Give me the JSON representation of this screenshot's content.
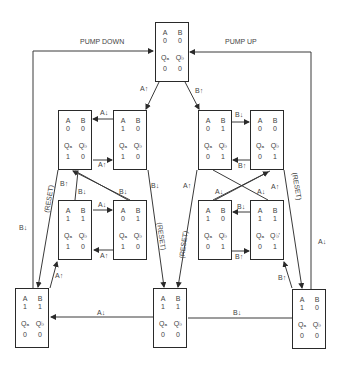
{
  "title_labels": {
    "pump_down": "PUMP DOWN",
    "pump_up": "PUMP UP"
  },
  "headers": {
    "a": "A",
    "b": "B",
    "qa": "Qₐ",
    "qb": "Q_b"
  },
  "states": [
    {
      "id": "top",
      "A": "0",
      "B": "0",
      "Qa": "0",
      "Qb": "0"
    },
    {
      "id": "ul1",
      "A": "0",
      "B": "0",
      "Qa": "1",
      "Qb": "0"
    },
    {
      "id": "ul2",
      "A": "1",
      "B": "0",
      "Qa": "1",
      "Qb": "0"
    },
    {
      "id": "ll1",
      "A": "1",
      "B": "1",
      "Qa": "1",
      "Qb": "0"
    },
    {
      "id": "ll2",
      "A": "0",
      "B": "1",
      "Qa": "1",
      "Qb": "0"
    },
    {
      "id": "ur1",
      "A": "0",
      "B": "1",
      "Qa": "0",
      "Qb": "1"
    },
    {
      "id": "ur2",
      "A": "0",
      "B": "0",
      "Qa": "0",
      "Qb": "1"
    },
    {
      "id": "lr1",
      "A": "1",
      "B": "0",
      "Qa": "0",
      "Qb": "1"
    },
    {
      "id": "lr2",
      "A": "1",
      "B": "1",
      "Qa": "0",
      "Qb": "1"
    },
    {
      "id": "bl",
      "A": "1",
      "B": "1",
      "Qa": "0",
      "Qb": "0"
    },
    {
      "id": "bm",
      "A": "1",
      "B": "1",
      "Qa": "0",
      "Qb": "0"
    },
    {
      "id": "br",
      "A": "1",
      "B": "0",
      "Qa": "0",
      "Qb": "0"
    }
  ],
  "transitions": {
    "a_up": "A↑",
    "a_down": "A↓",
    "b_up": "B↑",
    "b_down": "B↓",
    "reset": "(RESET)"
  }
}
